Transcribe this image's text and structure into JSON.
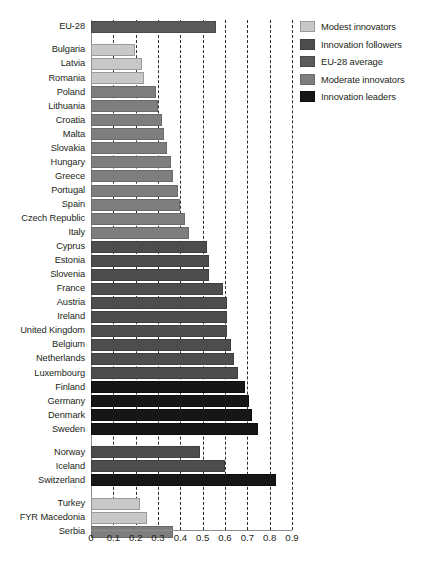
{
  "chart_data": {
    "type": "bar",
    "orientation": "horizontal",
    "title": "",
    "xlabel": "",
    "ylabel": "",
    "xlim": [
      0,
      0.9
    ],
    "grid": true,
    "grid_style": "dashed vertical",
    "tick_labels": [
      "0",
      "0.1",
      "0.2",
      "0.3",
      "0.4",
      "0.5",
      "0.6",
      "0.7",
      "0.8",
      "0.9"
    ],
    "tick_values": [
      0,
      0.1,
      0.2,
      0.3,
      0.4,
      0.5,
      0.6,
      0.7,
      0.8,
      0.9
    ],
    "legend_position": "right-top",
    "series": [
      {
        "name": "Modest innovators",
        "color": "#c8c8c8",
        "categories": [
          "Bulgaria",
          "Latvia",
          "Romania",
          "Turkey",
          "FYR Macedonia"
        ],
        "values": [
          0.19,
          0.22,
          0.23,
          0.21,
          0.24
        ]
      },
      {
        "name": "Innovation followers",
        "color": "#4d4d4d",
        "categories": [
          "Cyprus",
          "Estonia",
          "Slovenia",
          "France",
          "Austria",
          "Ireland",
          "United Kingdom",
          "Belgium",
          "Netherlands",
          "Luxembourg",
          "Norway",
          "Iceland"
        ],
        "values": [
          0.51,
          0.52,
          0.52,
          0.58,
          0.6,
          0.6,
          0.6,
          0.62,
          0.63,
          0.65,
          0.48,
          0.59
        ]
      },
      {
        "name": "EU-28 average",
        "color": "#5a5a5a",
        "categories": [
          "EU-28"
        ],
        "values": [
          0.55
        ]
      },
      {
        "name": "Moderate innovators",
        "color": "#7e7e7e",
        "categories": [
          "Poland",
          "Lithuania",
          "Croatia",
          "Malta",
          "Slovakia",
          "Hungary",
          "Greece",
          "Portugal",
          "Spain",
          "Czech Republic",
          "Italy",
          "Serbia"
        ],
        "values": [
          0.28,
          0.29,
          0.31,
          0.32,
          0.33,
          0.35,
          0.36,
          0.38,
          0.39,
          0.41,
          0.43,
          0.36
        ]
      },
      {
        "name": "Innovation leaders",
        "color": "#161616",
        "categories": [
          "Finland",
          "Germany",
          "Denmark",
          "Sweden",
          "Switzerland"
        ],
        "values": [
          0.68,
          0.7,
          0.71,
          0.74,
          0.82
        ]
      }
    ],
    "rows": [
      {
        "label": "EU-28",
        "value": 0.55,
        "group": "avg",
        "kind": "bar"
      },
      {
        "label": "",
        "value": null,
        "group": "",
        "kind": "gap"
      },
      {
        "label": "Bulgaria",
        "value": 0.19,
        "group": "modest",
        "kind": "bar"
      },
      {
        "label": "Latvia",
        "value": 0.22,
        "group": "modest",
        "kind": "bar"
      },
      {
        "label": "Romania",
        "value": 0.23,
        "group": "modest",
        "kind": "bar"
      },
      {
        "label": "Poland",
        "value": 0.28,
        "group": "moderate",
        "kind": "bar"
      },
      {
        "label": "Lithuania",
        "value": 0.29,
        "group": "moderate",
        "kind": "bar"
      },
      {
        "label": "Croatia",
        "value": 0.31,
        "group": "moderate",
        "kind": "bar"
      },
      {
        "label": "Malta",
        "value": 0.32,
        "group": "moderate",
        "kind": "bar"
      },
      {
        "label": "Slovakia",
        "value": 0.33,
        "group": "moderate",
        "kind": "bar"
      },
      {
        "label": "Hungary",
        "value": 0.35,
        "group": "moderate",
        "kind": "bar"
      },
      {
        "label": "Greece",
        "value": 0.36,
        "group": "moderate",
        "kind": "bar"
      },
      {
        "label": "Portugal",
        "value": 0.38,
        "group": "moderate",
        "kind": "bar"
      },
      {
        "label": "Spain",
        "value": 0.39,
        "group": "moderate",
        "kind": "bar"
      },
      {
        "label": "Czech Republic",
        "value": 0.41,
        "group": "moderate",
        "kind": "bar"
      },
      {
        "label": "Italy",
        "value": 0.43,
        "group": "moderate",
        "kind": "bar"
      },
      {
        "label": "Cyprus",
        "value": 0.51,
        "group": "follower",
        "kind": "bar"
      },
      {
        "label": "Estonia",
        "value": 0.52,
        "group": "follower",
        "kind": "bar"
      },
      {
        "label": "Slovenia",
        "value": 0.52,
        "group": "follower",
        "kind": "bar"
      },
      {
        "label": "France",
        "value": 0.58,
        "group": "follower",
        "kind": "bar"
      },
      {
        "label": "Austria",
        "value": 0.6,
        "group": "follower",
        "kind": "bar"
      },
      {
        "label": "Ireland",
        "value": 0.6,
        "group": "follower",
        "kind": "bar"
      },
      {
        "label": "United Kingdom",
        "value": 0.6,
        "group": "follower",
        "kind": "bar"
      },
      {
        "label": "Belgium",
        "value": 0.62,
        "group": "follower",
        "kind": "bar"
      },
      {
        "label": "Netherlands",
        "value": 0.63,
        "group": "follower",
        "kind": "bar"
      },
      {
        "label": "Luxembourg",
        "value": 0.65,
        "group": "follower",
        "kind": "bar"
      },
      {
        "label": "Finland",
        "value": 0.68,
        "group": "leader",
        "kind": "bar"
      },
      {
        "label": "Germany",
        "value": 0.7,
        "group": "leader",
        "kind": "bar"
      },
      {
        "label": "Denmark",
        "value": 0.71,
        "group": "leader",
        "kind": "bar"
      },
      {
        "label": "Sweden",
        "value": 0.74,
        "group": "leader",
        "kind": "bar"
      },
      {
        "label": "",
        "value": null,
        "group": "",
        "kind": "gap"
      },
      {
        "label": "Norway",
        "value": 0.48,
        "group": "follower",
        "kind": "bar"
      },
      {
        "label": "Iceland",
        "value": 0.59,
        "group": "follower",
        "kind": "bar"
      },
      {
        "label": "Switzerland",
        "value": 0.82,
        "group": "leader",
        "kind": "bar"
      },
      {
        "label": "",
        "value": null,
        "group": "",
        "kind": "gap"
      },
      {
        "label": "Turkey",
        "value": 0.21,
        "group": "modest",
        "kind": "bar"
      },
      {
        "label": "FYR Macedonia",
        "value": 0.24,
        "group": "modest",
        "kind": "bar"
      },
      {
        "label": "Serbia",
        "value": 0.36,
        "group": "moderate",
        "kind": "bar"
      }
    ]
  },
  "legend": {
    "items": [
      {
        "label": "Modest innovators",
        "group": "modest",
        "color": "#c8c8c8"
      },
      {
        "label": "Innovation followers",
        "group": "follower",
        "color": "#4d4d4d"
      },
      {
        "label": "EU-28 average",
        "group": "avg",
        "color": "#5a5a5a"
      },
      {
        "label": "Moderate innovators",
        "group": "moderate",
        "color": "#7e7e7e"
      },
      {
        "label": "Innovation leaders",
        "group": "leader",
        "color": "#161616"
      }
    ]
  }
}
